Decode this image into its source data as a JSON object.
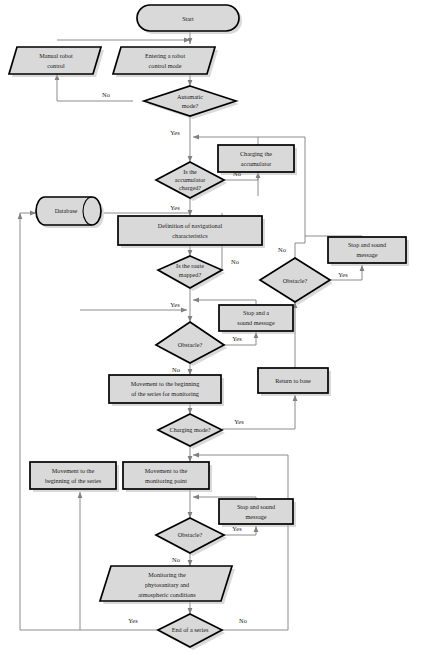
{
  "diagram": {
    "type": "flowchart",
    "colors": {
      "node_fill": "#d9d9d9",
      "node_stroke": "#000000",
      "connector": "#808080",
      "text": "#1a1a1a",
      "shadow": "#b9b9b9",
      "background": "#ffffff"
    },
    "nodes": [
      {
        "id": "start",
        "shape": "terminator",
        "lines": [
          "Start"
        ]
      },
      {
        "id": "manual",
        "shape": "parallelogram",
        "lines": [
          "Manual robot",
          "control"
        ]
      },
      {
        "id": "entering",
        "shape": "parallelogram",
        "lines": [
          "Entering a robot",
          "control mode"
        ]
      },
      {
        "id": "automatic",
        "shape": "decision",
        "lines": [
          "Automatic",
          "mode?"
        ]
      },
      {
        "id": "accumulator",
        "shape": "decision",
        "lines": [
          "Is the",
          "accumulator",
          "charged?"
        ]
      },
      {
        "id": "charging",
        "shape": "process",
        "lines": [
          "Charging the",
          "accumulator"
        ]
      },
      {
        "id": "database",
        "shape": "cylinder",
        "lines": [
          "Database"
        ]
      },
      {
        "id": "definition",
        "shape": "process",
        "lines": [
          "Definition of navigational",
          "characteristics"
        ]
      },
      {
        "id": "route",
        "shape": "decision",
        "lines": [
          "Is the route",
          "mapped?"
        ]
      },
      {
        "id": "obstacle_r",
        "shape": "decision",
        "lines": [
          "Obstacle?"
        ]
      },
      {
        "id": "stop_r",
        "shape": "process",
        "lines": [
          "Stop and sound",
          "message"
        ]
      },
      {
        "id": "obstacle_m",
        "shape": "decision",
        "lines": [
          "Obstacle?"
        ]
      },
      {
        "id": "stop_m",
        "shape": "process",
        "lines": [
          "Stop and a",
          "sound message"
        ]
      },
      {
        "id": "return_base",
        "shape": "process",
        "lines": [
          "Return to base"
        ]
      },
      {
        "id": "move_begin_mon",
        "shape": "process",
        "lines": [
          "Movement to the beginning",
          "of the series for monitoring"
        ]
      },
      {
        "id": "charge_mode",
        "shape": "decision",
        "lines": [
          "Charging mode?"
        ]
      },
      {
        "id": "move_begin",
        "shape": "process",
        "lines": [
          "Movement to the",
          "beginning of the series"
        ]
      },
      {
        "id": "move_point",
        "shape": "process",
        "lines": [
          "Movement to the",
          "monitoring point"
        ]
      },
      {
        "id": "obstacle_b",
        "shape": "decision",
        "lines": [
          "Obstacle?"
        ]
      },
      {
        "id": "stop_b",
        "shape": "process",
        "lines": [
          "Stop and sound",
          "message"
        ]
      },
      {
        "id": "monitoring",
        "shape": "parallelogram",
        "lines": [
          "Monitoring the",
          "phytosanitary and",
          "atmospheric conditions"
        ]
      },
      {
        "id": "end_series",
        "shape": "decision",
        "lines": [
          "End of a series"
        ]
      }
    ],
    "edge_labels": [
      {
        "id": "automatic_no",
        "text": "No"
      },
      {
        "id": "automatic_yes",
        "text": "Yes"
      },
      {
        "id": "accum_no",
        "text": "No"
      },
      {
        "id": "accum_yes",
        "text": "Yes"
      },
      {
        "id": "route_no",
        "text": "No"
      },
      {
        "id": "route_yes",
        "text": "Yes"
      },
      {
        "id": "obstacle_r_no",
        "text": "No"
      },
      {
        "id": "obstacle_r_yes",
        "text": "Yes"
      },
      {
        "id": "obstacle_m_yes",
        "text": "Yes"
      },
      {
        "id": "obstacle_m_no",
        "text": "No"
      },
      {
        "id": "charge_yes",
        "text": "Yes"
      },
      {
        "id": "obstacle_b_yes",
        "text": "Yes"
      },
      {
        "id": "obstacle_b_no",
        "text": "No"
      },
      {
        "id": "end_yes",
        "text": "Yes"
      },
      {
        "id": "end_no",
        "text": "No"
      }
    ]
  }
}
